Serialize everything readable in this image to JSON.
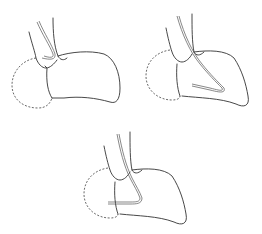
{
  "figure": {
    "panels": [
      {
        "id": "panel-top-left",
        "description": "catheter tip at atrial junction"
      },
      {
        "id": "panel-top-right",
        "description": "catheter looped into chamber"
      },
      {
        "id": "panel-bottom",
        "description": "catheter advanced into dashed chamber"
      }
    ],
    "colors": {
      "line": "#333333",
      "background": "#ffffff"
    }
  }
}
